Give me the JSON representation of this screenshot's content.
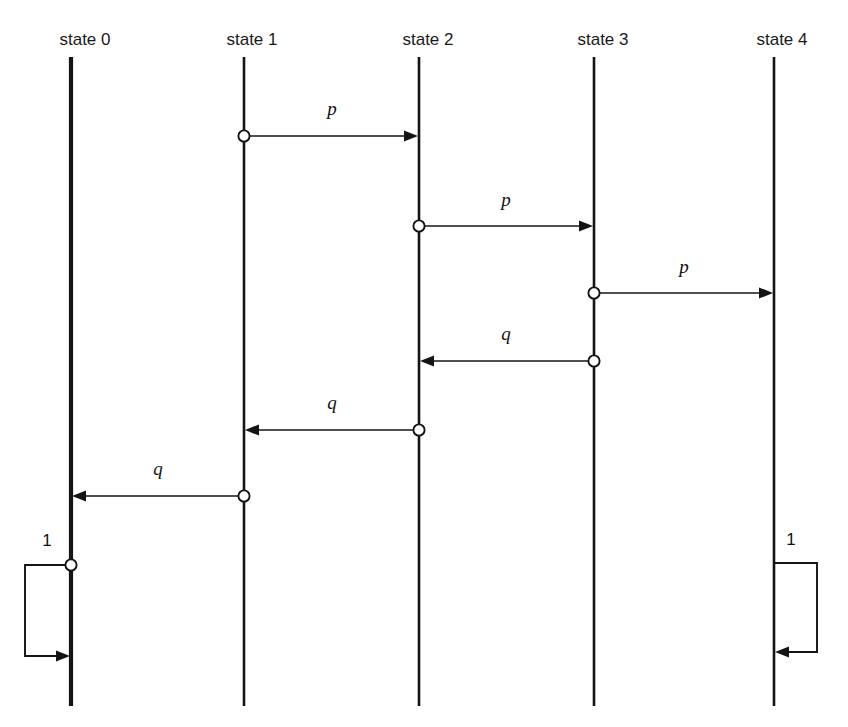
{
  "diagram": {
    "type": "sequence-diagram",
    "canvas": {
      "width": 848,
      "height": 727,
      "background": "#ffffff"
    },
    "ink_color": "#141414",
    "lifelines": [
      {
        "id": "s0",
        "label": "state 0",
        "x": 71,
        "top": 57,
        "bottom": 706,
        "width": 4.2,
        "label_x": 85,
        "label_y": 45
      },
      {
        "id": "s1",
        "label": "state 1",
        "x": 244,
        "top": 57,
        "bottom": 706,
        "width": 2.6,
        "label_x": 252,
        "label_y": 45
      },
      {
        "id": "s2",
        "label": "state 2",
        "x": 419,
        "top": 57,
        "bottom": 706,
        "width": 2.6,
        "label_x": 428,
        "label_y": 45
      },
      {
        "id": "s3",
        "label": "state 3",
        "x": 594,
        "top": 57,
        "bottom": 706,
        "width": 2.6,
        "label_x": 603,
        "label_y": 45
      },
      {
        "id": "s4",
        "label": "state 4",
        "x": 774,
        "top": 57,
        "bottom": 706,
        "width": 2.6,
        "label_x": 782,
        "label_y": 45
      }
    ],
    "messages": [
      {
        "id": "m1",
        "label": "p",
        "from": "s1",
        "to": "s2",
        "from_x": 244,
        "to_x": 419,
        "y": 136,
        "direction": "right",
        "label_x": 332,
        "label_y": 115,
        "source_dot": true
      },
      {
        "id": "m2",
        "label": "p",
        "from": "s2",
        "to": "s3",
        "from_x": 419,
        "to_x": 594,
        "y": 226,
        "direction": "right",
        "label_x": 506,
        "label_y": 206,
        "source_dot": true
      },
      {
        "id": "m3",
        "label": "p",
        "from": "s3",
        "to": "s4",
        "from_x": 594,
        "to_x": 774,
        "y": 293,
        "direction": "right",
        "label_x": 684,
        "label_y": 273,
        "source_dot": true
      },
      {
        "id": "m4",
        "label": "q",
        "from": "s3",
        "to": "s2",
        "from_x": 594,
        "to_x": 419,
        "y": 361,
        "direction": "left",
        "label_x": 506,
        "label_y": 340,
        "source_dot": true
      },
      {
        "id": "m5",
        "label": "q",
        "from": "s2",
        "to": "s1",
        "from_x": 419,
        "to_x": 244,
        "y": 430,
        "direction": "left",
        "label_x": 332,
        "label_y": 409,
        "source_dot": true
      },
      {
        "id": "m6",
        "label": "q",
        "from": "s1",
        "to": "s0",
        "from_x": 244,
        "to_x": 71,
        "y": 496,
        "direction": "left",
        "label_x": 158,
        "label_y": 475,
        "source_dot": true
      }
    ],
    "self_loops": [
      {
        "id": "loop-left",
        "label": "1",
        "on": "s0",
        "side": "left",
        "lifeline_x": 71,
        "start_y": 565,
        "end_y": 656,
        "extent_x": 25,
        "label_x": 47,
        "label_y": 546,
        "source_dot": true,
        "arrow_direction": "right"
      },
      {
        "id": "loop-right",
        "label": "1",
        "on": "s4",
        "side": "right",
        "lifeline_x": 774,
        "start_y": 563,
        "end_y": 652,
        "extent_x": 817,
        "label_x": 791,
        "label_y": 545,
        "source_dot": false,
        "arrow_direction": "left"
      }
    ]
  }
}
